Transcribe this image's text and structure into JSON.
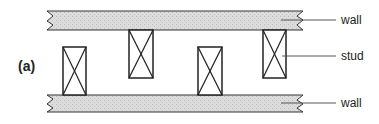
{
  "figure": {
    "panel_label": "(a)",
    "labels": {
      "top_wall": "wall",
      "stud": "stud",
      "bottom_wall": "wall"
    },
    "colors": {
      "wall_fill": "#d9d9d9",
      "stroke": "#333333",
      "text": "#222222"
    },
    "studs": [
      {
        "x": 63,
        "y": 47,
        "w": 23,
        "h": 48
      },
      {
        "x": 129,
        "y": 30,
        "w": 24,
        "h": 48
      },
      {
        "x": 198,
        "y": 47,
        "w": 24,
        "h": 48
      },
      {
        "x": 263,
        "y": 30,
        "w": 23,
        "h": 48
      }
    ]
  }
}
